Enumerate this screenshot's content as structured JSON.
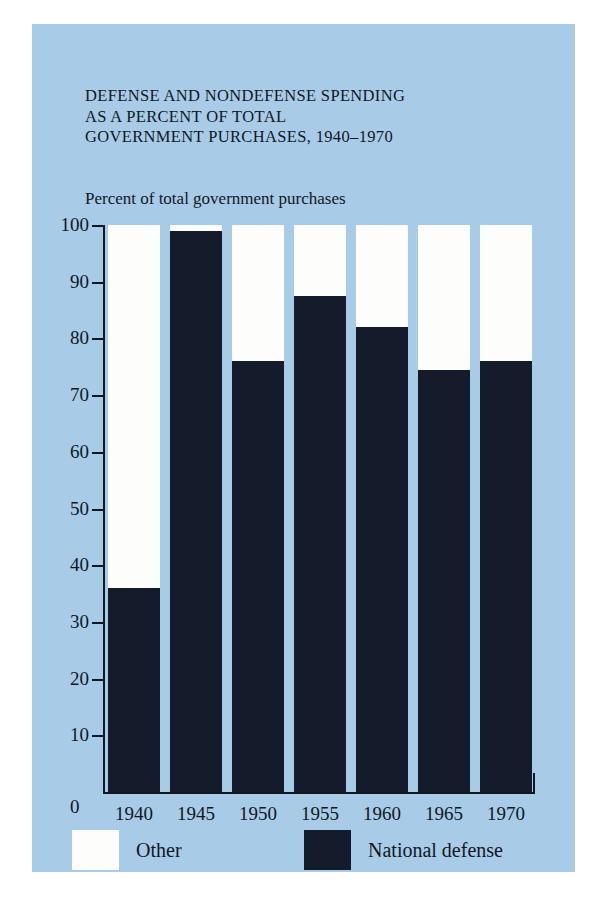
{
  "figure": {
    "background_color": "#a8cbe8",
    "title_lines": [
      "DEFENSE AND NONDEFENSE SPENDING",
      "AS A PERCENT OF TOTAL",
      "GOVERNMENT PURCHASES, 1940–1970"
    ],
    "subtitle": "Percent of total government purchases",
    "zero_label": "0"
  },
  "legend": {
    "items": [
      {
        "label": "Other",
        "color": "#fdfdfb"
      },
      {
        "label": "National defense",
        "color": "#141c2c"
      }
    ]
  },
  "chart_data": {
    "type": "bar",
    "title": "DEFENSE AND NONDEFENSE SPENDING AS A PERCENT OF TOTAL GOVERNMENT PURCHASES, 1940–1970",
    "subtitle": "Percent of total government purchases",
    "xlabel": "",
    "ylabel": "Percent of total government purchases",
    "ylim": [
      0,
      100
    ],
    "yticks": [
      0,
      10,
      20,
      30,
      40,
      50,
      60,
      70,
      80,
      90,
      100
    ],
    "ytick_labels": [
      "0",
      "10",
      "20",
      "30",
      "40",
      "50",
      "60",
      "70",
      "80",
      "90",
      "100"
    ],
    "grid": false,
    "stacked": true,
    "legend_position": "bottom",
    "categories": [
      "1940",
      "1945",
      "1950",
      "1955",
      "1960",
      "1965",
      "1970"
    ],
    "series": [
      {
        "name": "National defense",
        "color": "#141c2c",
        "values": [
          36,
          99,
          76,
          87.5,
          82,
          74.5,
          76
        ]
      },
      {
        "name": "Other",
        "color": "#fdfdfb",
        "values": [
          64,
          1,
          24,
          12.5,
          18,
          25.5,
          24
        ]
      }
    ]
  }
}
